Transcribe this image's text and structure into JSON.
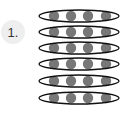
{
  "label": {
    "text": "1."
  },
  "diagram": {
    "rows": 6,
    "dots_per_row": 4,
    "row_centers_y": [
      16,
      32,
      48,
      64,
      81,
      98
    ],
    "dot_centers_x": [
      54,
      71,
      88,
      106
    ],
    "ellipse": {
      "cx": 79,
      "rx": 40,
      "ry": 6
    },
    "dot_radius": 5.2,
    "colors": {
      "dot": "#777777",
      "ellipse_stroke": "#111111",
      "badge_bg": "#eeeeee"
    }
  }
}
